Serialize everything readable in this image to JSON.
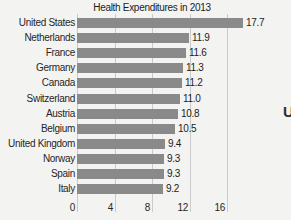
{
  "fragment_text": "U",
  "colors": {
    "background": "#f3f3f1",
    "bar": "#8a8a8a",
    "gridline": "#cacaca",
    "text": "#262626"
  },
  "chart_data": {
    "type": "bar",
    "orientation": "horizontal",
    "title": "Health Expenditures in 2013",
    "categories": [
      "United States",
      "Netherlands",
      "France",
      "Germany",
      "Canada",
      "Switzerland",
      "Austria",
      "Belgium",
      "United Kingdom",
      "Norway",
      "Spain",
      "Italy"
    ],
    "values": [
      17.7,
      11.9,
      11.6,
      11.3,
      11.2,
      11.0,
      10.8,
      10.5,
      9.4,
      9.3,
      9.3,
      9.2
    ],
    "value_labels": [
      "17.7",
      "11.9",
      "11.6",
      "11.3",
      "11.2",
      "11.0",
      "10.8",
      "10.5",
      "9.4",
      "9.3",
      "9.3",
      "9.2"
    ],
    "x_ticks": [
      0,
      4,
      8,
      12,
      16
    ],
    "x_tick_labels": [
      "0",
      "4",
      "8",
      "12",
      "16"
    ],
    "xlim": [
      0,
      16
    ],
    "ylabel": "",
    "xlabel": "",
    "grid": true,
    "legend": false
  }
}
